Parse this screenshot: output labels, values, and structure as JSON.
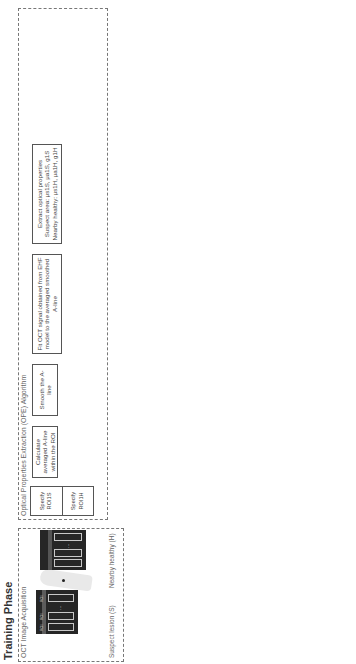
{
  "figure": {
    "caption_label": "FIGURE 4.1",
    "caption_line1": "Principles of optical radiomic melanoma detection (ORMD) protocol. (μs: scattering coefficient, μa: absorption coef-",
    "caption_line2": "ficient, g: anisotropy factor.)"
  },
  "training_phase": {
    "title": "Training Phase",
    "acquisition": {
      "title": "OCT Image Acquisition",
      "suspect_label": "Suspect lesion (S)",
      "healthy_label": "Nearby healthy (H)",
      "roi_labels": [
        "ROI",
        "ROI",
        "ROI"
      ],
      "ellipsis": "..."
    },
    "ope": {
      "title": "Optical Properties Extraction (OPE) Algorithm",
      "rows": [
        {
          "specify_s": "Specify ROI1S",
          "specify_h": "Specify ROI1H",
          "calc": "Calculate averaged A-line within the ROI",
          "smooth": "Smooth the A-line",
          "fit": "Fit OCT signal obtained from EHF model to the averaged smoothed A-line",
          "extract_title": "Extract optical properties",
          "extract_s": "Suspect area: μs1S, μa1S, g1S",
          "extract_h": "Nearby healthy: μs1H, μa1H, g1H"
        },
        {
          "specify_s": "Specify ROI2S",
          "specify_h": "Specify ROI2H",
          "calc": "Calculate averaged A-line within the ROI",
          "smooth": "Smooth the A-line",
          "fit": "Fit OCT signal obtained from EHF model to the averaged smoothed A-line",
          "extract_title": "Extract optical properties",
          "extract_s": "Suspect area: μs2S, μa2S, g2S",
          "extract_h": "Nearby healthy: μs2H, μa2H, g2H"
        },
        {
          "specify_s": "Specify ROInS",
          "specify_h": "Specify ROInH",
          "calc": "Calculate averaged A-line within the ROI",
          "smooth": "Smooth the A-line",
          "fit": "Fit OCT signal obtained from EHF model to the averaged smoothed A-line",
          "extract_title": "Extract optical properties",
          "extract_s": "Suspect area: μsnS, μanS, gnS",
          "extract_h": "Nearby healthy: μsnH, μanH, gnH"
        }
      ],
      "ellipsis": ". . ."
    },
    "features_generation": {
      "title": "Optical Radiomic Features Generation",
      "cells": [
        [
          "Mean of μsS & μsH",
          "Standard deviation of μsS & μsH"
        ],
        [
          "Mean of μaS & μaH",
          "Standard deviation of μaS & μaH"
        ],
        [
          "Mean of gS & gH",
          "Standard deviation of gS & gH"
        ]
      ]
    },
    "normalized_features": {
      "title": "Normalized Optical Radiomic Features",
      "cells": [
        [
          "F1: μsS / μsH",
          "F3: σμsS / σμsH"
        ],
        [
          "F2: μaS / μaH",
          "F4: σμaS / σμaH"
        ],
        [
          "F3: gS / gH",
          "F5: σgS / σgH"
        ]
      ]
    },
    "feature_selection": "Feature Selection & Machine Learning Algorithm",
    "histology": "Histology Result (Lables)",
    "trained_classifier": "Trained Machine-Learning Classifier"
  },
  "test_phase": {
    "title": "Test Phase",
    "steps": [
      "OCT Images",
      "Optical Properties Extraction",
      "Selected Normalized Optical Radiomic Features (Optical Radiomic Signatures)",
      "Trained Machine-Learning Classifier"
    ],
    "outcomes": [
      "\"Tissue sample exhibits characteristics consistent with melanoma\"",
      "\"Tissue sample exhibits characteristics consistent with healthy tissue\""
    ]
  }
}
